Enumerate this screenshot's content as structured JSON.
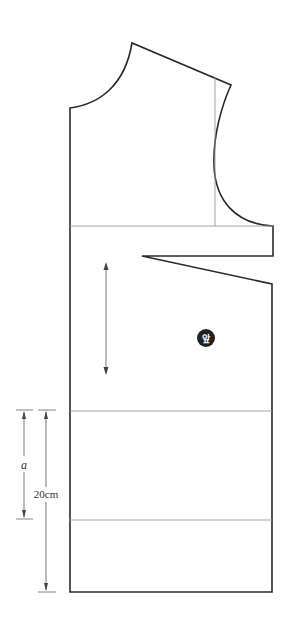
{
  "diagram": {
    "type": "sewing-pattern",
    "piece": "front bodice",
    "badge": {
      "label": "앞",
      "color": "#222222"
    },
    "dimensions": {
      "a": {
        "label": "a"
      },
      "length": {
        "label": "20cm"
      }
    },
    "colors": {
      "outline": "#2a2a2a",
      "guide": "#9a9a9a",
      "background": "#ffffff"
    }
  }
}
